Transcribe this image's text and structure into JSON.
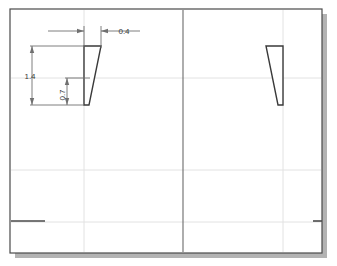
{
  "canvas": {
    "width": 337,
    "height": 266,
    "background": "#ffffff"
  },
  "colors": {
    "page_fill": "#ffffff",
    "frame_stroke": "#4a4a4a",
    "shadow": "#b3b3b3",
    "grid_line": "#e2e2e2",
    "center_line": "#6b6b6b",
    "profile_stroke": "#3a3a3a",
    "dimension_stroke": "#707070",
    "dimension_text": "#3a3a3a",
    "accent_dark": "#4a4a4a"
  },
  "drawing": {
    "title": "tapered-wedge-profile-drawing",
    "page_frame": {
      "x": 10,
      "y": 9,
      "width": 312,
      "height": 244
    },
    "shadow_offset": 5,
    "grid": {
      "vertical_light": [
        84,
        283
      ],
      "vertical_dark": [
        183
      ],
      "horizontal_light": [
        78,
        170,
        222
      ]
    },
    "profiles": [
      {
        "name": "left-wedge",
        "points": "84,46 101,46 89,105 84,105",
        "top_y": 46,
        "bottom_y": 105
      },
      {
        "name": "right-wedge",
        "points": "266,46 283,46 283,105 278,105",
        "top_y": 46,
        "bottom_y": 105
      }
    ]
  },
  "dimensions": [
    {
      "id": "width-04",
      "label": "0.4",
      "orientation": "horizontal",
      "value": 0.4,
      "line_y": 31,
      "from_x": 84,
      "to_x": 101,
      "text_x": 124,
      "text_y": 34
    },
    {
      "id": "height-14",
      "label": "1.4",
      "orientation": "vertical",
      "value": 1.4,
      "line_x": 32,
      "from_y": 46,
      "to_y": 105,
      "text_x": 30,
      "text_y": 79
    },
    {
      "id": "height-07",
      "label": "0.7",
      "orientation": "vertical",
      "value": 0.7,
      "line_x": 67,
      "from_y": 78,
      "to_y": 105,
      "text_x": 65,
      "text_y": 94
    }
  ],
  "markers": [
    {
      "name": "baseline-segment-left",
      "x1": 11,
      "y1": 221,
      "x2": 45,
      "y2": 221
    },
    {
      "name": "baseline-segment-right",
      "x1": 313,
      "y1": 221,
      "x2": 322,
      "y2": 221
    }
  ]
}
